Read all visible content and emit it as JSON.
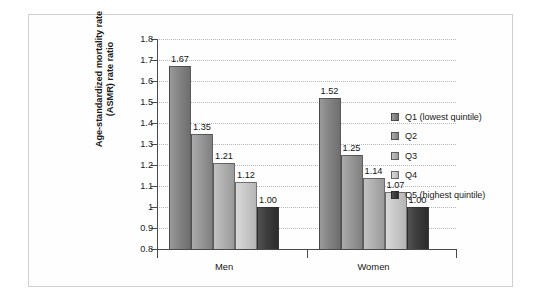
{
  "chart_data": {
    "type": "bar",
    "title": "",
    "subtitle": "",
    "xlabel": "",
    "ylabel_lines": [
      "Age-standardized mortality rate",
      "(ASMR) rate ratio"
    ],
    "ylabel": "Age-standardized mortality rate (ASMR) rate ratio",
    "categories": [
      "Men",
      "Women"
    ],
    "ylim": [
      0.8,
      1.8
    ],
    "ytick_labels": [
      "0.8",
      "0.9",
      "1",
      "1.1",
      "1.2",
      "1.3",
      "1.4",
      "1.5",
      "1.6",
      "1.7",
      "1.8"
    ],
    "ytick_values": [
      0.8,
      0.9,
      1.0,
      1.1,
      1.2,
      1.3,
      1.4,
      1.5,
      1.6,
      1.7,
      1.8
    ],
    "grid": "horizontal-dotted",
    "legend_position": "right",
    "series": [
      {
        "name": "Q1 (lowest quintile)",
        "short": "Q1",
        "color": "#848484",
        "color_light": "#9a9a9a",
        "color_dark": "#6e6e6e",
        "values": [
          1.67,
          1.52
        ],
        "labels": [
          "1.67",
          "1.52"
        ]
      },
      {
        "name": "Q2",
        "short": "Q2",
        "color": "#979797",
        "color_light": "#ababab",
        "color_dark": "#808080",
        "values": [
          1.35,
          1.25
        ],
        "labels": [
          "1.35",
          "1.25"
        ]
      },
      {
        "name": "Q3",
        "short": "Q3",
        "color": "#b0b0b0",
        "color_light": "#c2c2c2",
        "color_dark": "#9a9a9a",
        "values": [
          1.21,
          1.14
        ],
        "labels": [
          "1.21",
          "1.14"
        ]
      },
      {
        "name": "Q4",
        "short": "Q4",
        "color": "#c9c9c9",
        "color_light": "#d8d8d8",
        "color_dark": "#b5b5b5",
        "values": [
          1.12,
          1.07
        ],
        "labels": [
          "1.12",
          "1.07"
        ]
      },
      {
        "name": "Q5 (highest quintile)",
        "short": "Q5",
        "color": "#3d3d3d",
        "color_light": "#525252",
        "color_dark": "#2c2c2c",
        "values": [
          1.0,
          1.0
        ],
        "labels": [
          "1.00",
          "1.00"
        ]
      }
    ]
  },
  "legend": {
    "items": [
      {
        "label": "Q1 (lowest quintile)"
      },
      {
        "label": "Q2"
      },
      {
        "label": "Q3"
      },
      {
        "label": "Q4"
      },
      {
        "label": "Q5 (highest quintile)"
      }
    ]
  },
  "axis": {
    "y_title_line1": "Age-standardized mortality rate",
    "y_title_line2": "(ASMR) rate ratio"
  },
  "colors": {
    "frame_border": "#cfcfcf",
    "grid": "#b9b9b9",
    "axis": "#4a4a4a",
    "text": "#1b1b1b",
    "background": "#ffffff"
  }
}
